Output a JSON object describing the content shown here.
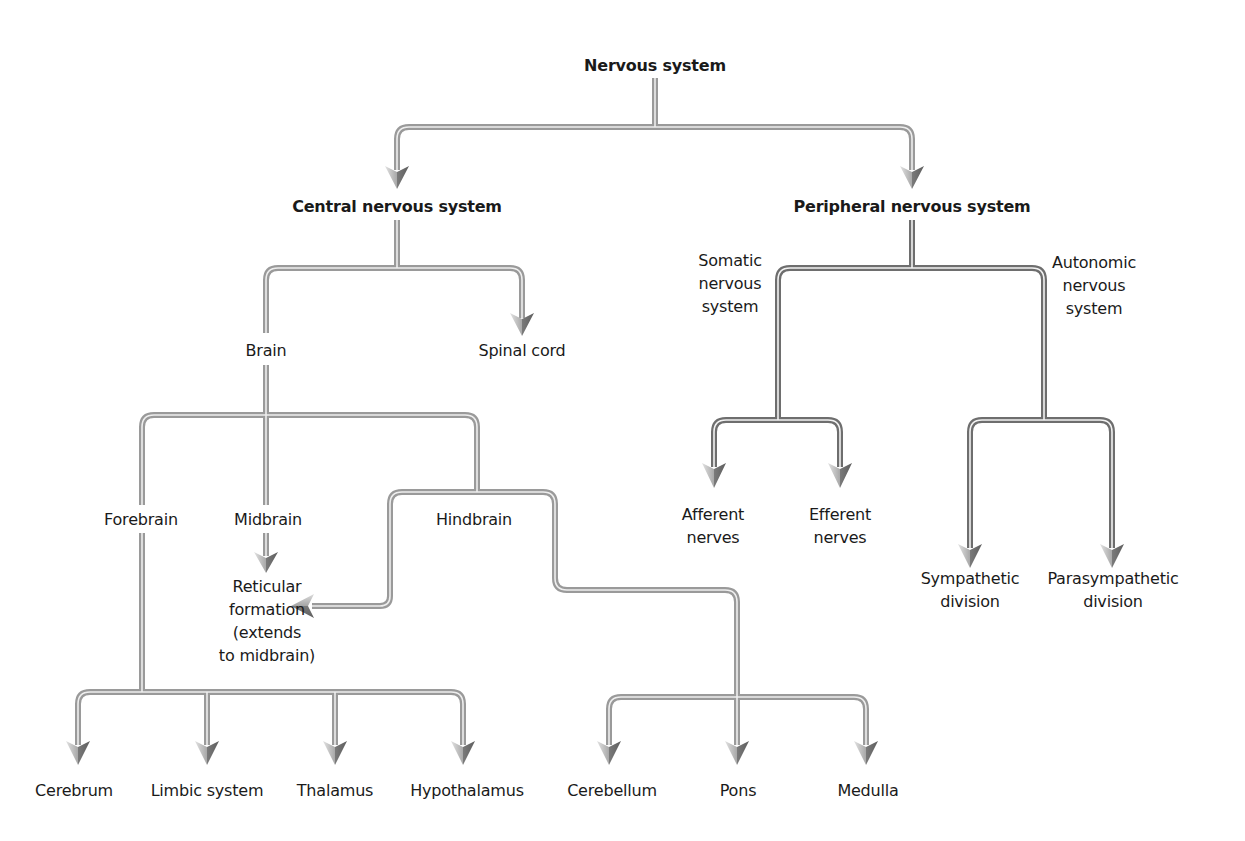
{
  "title": "Nervous system",
  "colors": {
    "pipe_light": "#9a9a9a",
    "pipe_dark": "#6e6e6e",
    "pipe_inner": "#e6e6e6",
    "arrow_light": "#d9d9d9",
    "arrow_dark": "#707070",
    "text": "#1a1a1a"
  },
  "nodes": {
    "root": {
      "label": "Nervous system",
      "x": 655,
      "y": 65
    },
    "cns": {
      "label": "Central nervous system",
      "x": 397,
      "y": 206
    },
    "pns": {
      "label": "Peripheral nervous system",
      "x": 912,
      "y": 206
    },
    "brain": {
      "label": "Brain",
      "x": 266,
      "y": 350
    },
    "spinal_cord": {
      "label": "Spinal cord",
      "x": 522,
      "y": 350
    },
    "somatic": {
      "label": "Somatic\nnervous\nsystem",
      "x": 730,
      "y": 283
    },
    "autonomic": {
      "label": "Autonomic\nnervous\nsystem",
      "x": 1094,
      "y": 285
    },
    "forebrain": {
      "label": "Forebrain",
      "x": 141,
      "y": 519
    },
    "midbrain": {
      "label": "Midbrain",
      "x": 268,
      "y": 519
    },
    "hindbrain": {
      "label": "Hindbrain",
      "x": 474,
      "y": 519
    },
    "reticular": {
      "label": "Reticular\nformation\n(extends\nto midbrain)",
      "x": 267,
      "y": 621
    },
    "afferent": {
      "label": "Afferent\nnerves",
      "x": 713,
      "y": 526
    },
    "efferent": {
      "label": "Efferent\nnerves",
      "x": 840,
      "y": 526
    },
    "sympathetic": {
      "label": "Sympathetic\ndivision",
      "x": 970,
      "y": 590
    },
    "parasympathetic": {
      "label": "Parasympathetic\ndivision",
      "x": 1113,
      "y": 590
    },
    "cerebrum": {
      "label": "Cerebrum",
      "x": 74,
      "y": 790
    },
    "limbic": {
      "label": "Limbic system",
      "x": 207,
      "y": 790
    },
    "thalamus": {
      "label": "Thalamus",
      "x": 335,
      "y": 790
    },
    "hypothalamus": {
      "label": "Hypothalamus",
      "x": 467,
      "y": 790
    },
    "cerebellum": {
      "label": "Cerebellum",
      "x": 612,
      "y": 790
    },
    "pons": {
      "label": "Pons",
      "x": 738,
      "y": 790
    },
    "medulla": {
      "label": "Medulla",
      "x": 868,
      "y": 790
    }
  },
  "edges": [
    {
      "from": "Nervous system",
      "to": "Central nervous system"
    },
    {
      "from": "Nervous system",
      "to": "Peripheral nervous system"
    },
    {
      "from": "Central nervous system",
      "to": "Brain"
    },
    {
      "from": "Central nervous system",
      "to": "Spinal cord"
    },
    {
      "from": "Brain",
      "to": "Forebrain"
    },
    {
      "from": "Brain",
      "to": "Midbrain"
    },
    {
      "from": "Brain",
      "to": "Hindbrain"
    },
    {
      "from": "Midbrain",
      "to": "Reticular formation (extends to midbrain)"
    },
    {
      "from": "Hindbrain",
      "to": "Reticular formation (extends to midbrain)"
    },
    {
      "from": "Forebrain",
      "to": "Cerebrum"
    },
    {
      "from": "Forebrain",
      "to": "Limbic system"
    },
    {
      "from": "Forebrain",
      "to": "Thalamus"
    },
    {
      "from": "Forebrain",
      "to": "Hypothalamus"
    },
    {
      "from": "Hindbrain",
      "to": "Cerebellum"
    },
    {
      "from": "Hindbrain",
      "to": "Pons"
    },
    {
      "from": "Hindbrain",
      "to": "Medulla"
    },
    {
      "from": "Peripheral nervous system",
      "to": "Somatic nervous system"
    },
    {
      "from": "Peripheral nervous system",
      "to": "Autonomic nervous system"
    },
    {
      "from": "Somatic nervous system",
      "to": "Afferent nerves"
    },
    {
      "from": "Somatic nervous system",
      "to": "Efferent nerves"
    },
    {
      "from": "Autonomic nervous system",
      "to": "Sympathetic division"
    },
    {
      "from": "Autonomic nervous system",
      "to": "Parasympathetic division"
    }
  ]
}
